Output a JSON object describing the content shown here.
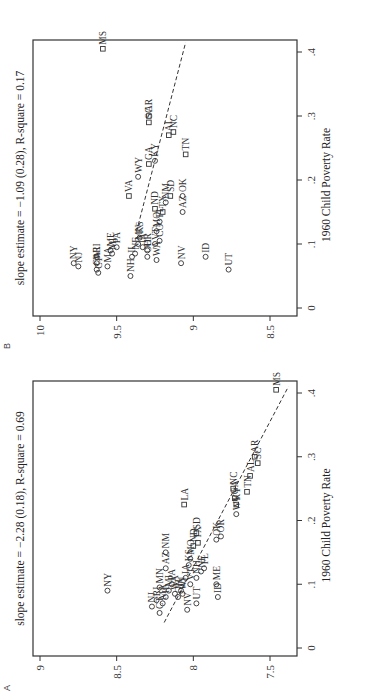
{
  "chart_data": [
    {
      "panel": "A",
      "type": "scatter",
      "title": "slope estimate = −2.28 (0.18), R-square = 0.69",
      "xlabel": "1960 Child Poverty Rate",
      "ylabel": "",
      "xlim": [
        0,
        0.42
      ],
      "ylim": [
        7.35,
        9.05
      ],
      "xticks": [
        "0",
        ".1",
        ".2",
        ".3",
        ".4"
      ],
      "yticks": [
        "9",
        "8.5",
        "8",
        "7.5"
      ],
      "rotation": "90deg counterclockwise",
      "fit_line": {
        "x": [
          0.04,
          0.41
        ],
        "y": [
          8.19,
          7.38
        ]
      },
      "points": [
        {
          "state": "NY",
          "x": 0.09,
          "y": 8.56,
          "marker": "circle"
        },
        {
          "state": "NJ",
          "x": 0.065,
          "y": 8.27,
          "marker": "circle"
        },
        {
          "state": "CT",
          "x": 0.055,
          "y": 8.22,
          "marker": "circle"
        },
        {
          "state": "MA",
          "x": 0.07,
          "y": 8.2,
          "marker": "circle"
        },
        {
          "state": "RI",
          "x": 0.075,
          "y": 8.24,
          "marker": "circle"
        },
        {
          "state": "IL",
          "x": 0.08,
          "y": 8.18,
          "marker": "circle"
        },
        {
          "state": "MN",
          "x": 0.095,
          "y": 8.22,
          "marker": "circle"
        },
        {
          "state": "MI",
          "x": 0.09,
          "y": 8.16,
          "marker": "circle"
        },
        {
          "state": "WA",
          "x": 0.085,
          "y": 8.12,
          "marker": "circle"
        },
        {
          "state": "OH",
          "x": 0.08,
          "y": 8.1,
          "marker": "circle"
        },
        {
          "state": "PA",
          "x": 0.1,
          "y": 8.14,
          "marker": "circle"
        },
        {
          "state": "WI",
          "x": 0.085,
          "y": 8.07,
          "marker": "circle"
        },
        {
          "state": "IN",
          "x": 0.09,
          "y": 8.08,
          "marker": "circle"
        },
        {
          "state": "AZ",
          "x": 0.125,
          "y": 8.18,
          "marker": "circle"
        },
        {
          "state": "NM",
          "x": 0.15,
          "y": 8.18,
          "marker": "circle"
        },
        {
          "state": "IA",
          "x": 0.11,
          "y": 8.05,
          "marker": "circle"
        },
        {
          "state": "VT",
          "x": 0.1,
          "y": 8.02,
          "marker": "circle"
        },
        {
          "state": "NV",
          "x": 0.06,
          "y": 8.04,
          "marker": "circle"
        },
        {
          "state": "UT",
          "x": 0.07,
          "y": 7.98,
          "marker": "circle"
        },
        {
          "state": "NH",
          "x": 0.11,
          "y": 7.98,
          "marker": "circle"
        },
        {
          "state": "MO",
          "x": 0.14,
          "y": 8.02,
          "marker": "circle"
        },
        {
          "state": "ND",
          "x": 0.16,
          "y": 8.0,
          "marker": "square"
        },
        {
          "state": "KS",
          "x": 0.13,
          "y": 8.03,
          "marker": "circle"
        },
        {
          "state": "NE",
          "x": 0.12,
          "y": 7.95,
          "marker": "circle"
        },
        {
          "state": "FL",
          "x": 0.125,
          "y": 7.93,
          "marker": "circle"
        },
        {
          "state": "TX",
          "x": 0.165,
          "y": 7.97,
          "marker": "square"
        },
        {
          "state": "SD",
          "x": 0.18,
          "y": 7.98,
          "marker": "square"
        },
        {
          "state": "LA",
          "x": 0.225,
          "y": 8.06,
          "marker": "square"
        },
        {
          "state": "ME",
          "x": 0.1,
          "y": 7.85,
          "marker": "circle"
        },
        {
          "state": "ID",
          "x": 0.08,
          "y": 7.84,
          "marker": "circle"
        },
        {
          "state": "OK",
          "x": 0.17,
          "y": 7.85,
          "marker": "circle"
        },
        {
          "state": "OR",
          "x": 0.175,
          "y": 7.82,
          "marker": "circle"
        },
        {
          "state": "WV",
          "x": 0.21,
          "y": 7.72,
          "marker": "circle"
        },
        {
          "state": "KY",
          "x": 0.225,
          "y": 7.72,
          "marker": "square"
        },
        {
          "state": "GA",
          "x": 0.235,
          "y": 7.73,
          "marker": "square"
        },
        {
          "state": "NC",
          "x": 0.25,
          "y": 7.74,
          "marker": "square"
        },
        {
          "state": "TN",
          "x": 0.245,
          "y": 7.65,
          "marker": "square"
        },
        {
          "state": "AL",
          "x": 0.27,
          "y": 7.63,
          "marker": "square"
        },
        {
          "state": "SC",
          "x": 0.29,
          "y": 7.58,
          "marker": "square"
        },
        {
          "state": "AR",
          "x": 0.3,
          "y": 7.6,
          "marker": "square"
        },
        {
          "state": "MS",
          "x": 0.405,
          "y": 7.46,
          "marker": "square"
        }
      ]
    },
    {
      "panel": "B",
      "type": "scatter",
      "title": "slope estimate = −1.09 (0.28), R-square = 0.17",
      "xlabel": "1960 Child Poverty Rate",
      "ylabel": "",
      "xlim": [
        0,
        0.42
      ],
      "ylim": [
        8.35,
        10.05
      ],
      "xticks": [
        "0",
        ".1",
        ".2",
        ".3",
        ".4"
      ],
      "yticks": [
        "10",
        "9.5",
        "9",
        "8.5"
      ],
      "rotation": "90deg counterclockwise",
      "fit_line": {
        "x": [
          0.12,
          0.415
        ],
        "y": [
          9.37,
          9.05
        ]
      },
      "points": [
        {
          "state": "NY",
          "x": 0.07,
          "y": 9.78,
          "marker": "circle"
        },
        {
          "state": "NJ",
          "x": 0.065,
          "y": 9.75,
          "marker": "circle"
        },
        {
          "state": "RI",
          "x": 0.08,
          "y": 9.63,
          "marker": "circle"
        },
        {
          "state": "CT",
          "x": 0.055,
          "y": 9.62,
          "marker": "circle"
        },
        {
          "state": "CA",
          "x": 0.06,
          "y": 9.63,
          "marker": "circle"
        },
        {
          "state": "WI",
          "x": 0.07,
          "y": 9.63,
          "marker": "circle"
        },
        {
          "state": "MA",
          "x": 0.065,
          "y": 9.56,
          "marker": "circle"
        },
        {
          "state": "MI",
          "x": 0.085,
          "y": 9.53,
          "marker": "circle"
        },
        {
          "state": "ME",
          "x": 0.09,
          "y": 9.54,
          "marker": "circle"
        },
        {
          "state": "PA",
          "x": 0.095,
          "y": 9.5,
          "marker": "circle"
        },
        {
          "state": "NH",
          "x": 0.05,
          "y": 9.41,
          "marker": "circle"
        },
        {
          "state": "IL",
          "x": 0.08,
          "y": 9.4,
          "marker": "circle"
        },
        {
          "state": "NE",
          "x": 0.085,
          "y": 9.38,
          "marker": "circle"
        },
        {
          "state": "MN",
          "x": 0.1,
          "y": 9.36,
          "marker": "circle"
        },
        {
          "state": "KS",
          "x": 0.11,
          "y": 9.35,
          "marker": "circle"
        },
        {
          "state": "IA",
          "x": 0.095,
          "y": 9.33,
          "marker": "circle"
        },
        {
          "state": "OR",
          "x": 0.09,
          "y": 9.3,
          "marker": "circle"
        },
        {
          "state": "OH",
          "x": 0.08,
          "y": 9.3,
          "marker": "circle"
        },
        {
          "state": "WA",
          "x": 0.075,
          "y": 9.24,
          "marker": "circle"
        },
        {
          "state": "VT",
          "x": 0.1,
          "y": 9.25,
          "marker": "circle"
        },
        {
          "state": "MO",
          "x": 0.12,
          "y": 9.24,
          "marker": "circle"
        },
        {
          "state": "CO",
          "x": 0.105,
          "y": 9.22,
          "marker": "circle"
        },
        {
          "state": "FL",
          "x": 0.135,
          "y": 9.22,
          "marker": "circle"
        },
        {
          "state": "TX",
          "x": 0.15,
          "y": 9.2,
          "marker": "square"
        },
        {
          "state": "ND",
          "x": 0.155,
          "y": 9.25,
          "marker": "square"
        },
        {
          "state": "NM",
          "x": 0.165,
          "y": 9.18,
          "marker": "circle"
        },
        {
          "state": "SD",
          "x": 0.175,
          "y": 9.15,
          "marker": "square"
        },
        {
          "state": "VA",
          "x": 0.175,
          "y": 9.42,
          "marker": "square"
        },
        {
          "state": "WY",
          "x": 0.205,
          "y": 9.36,
          "marker": "circle"
        },
        {
          "state": "GA",
          "x": 0.225,
          "y": 9.29,
          "marker": "square"
        },
        {
          "state": "KY",
          "x": 0.23,
          "y": 9.25,
          "marker": "circle"
        },
        {
          "state": "SC",
          "x": 0.29,
          "y": 9.29,
          "marker": "square"
        },
        {
          "state": "AR",
          "x": 0.3,
          "y": 9.29,
          "marker": "square"
        },
        {
          "state": "AL",
          "x": 0.27,
          "y": 9.16,
          "marker": "square"
        },
        {
          "state": "NC",
          "x": 0.275,
          "y": 9.13,
          "marker": "square"
        },
        {
          "state": "NV",
          "x": 0.07,
          "y": 9.08,
          "marker": "circle"
        },
        {
          "state": "AZ",
          "x": 0.15,
          "y": 9.07,
          "marker": "circle"
        },
        {
          "state": "OK",
          "x": 0.175,
          "y": 9.07,
          "marker": "circle"
        },
        {
          "state": "TN",
          "x": 0.24,
          "y": 9.05,
          "marker": "square"
        },
        {
          "state": "ID",
          "x": 0.08,
          "y": 8.92,
          "marker": "circle"
        },
        {
          "state": "UT",
          "x": 0.06,
          "y": 8.77,
          "marker": "circle"
        },
        {
          "state": "MS",
          "x": 0.405,
          "y": 9.59,
          "marker": "square"
        }
      ]
    }
  ],
  "panels": {
    "A": {
      "label": "A",
      "title": "slope estimate = −2.28 (0.18), R-square = 0.69",
      "xlabel": "1960 Child Poverty Rate"
    },
    "B": {
      "label": "B",
      "title": "slope estimate = −1.09 (0.28), R-square = 0.17",
      "xlabel": "1960 Child Poverty Rate"
    }
  }
}
